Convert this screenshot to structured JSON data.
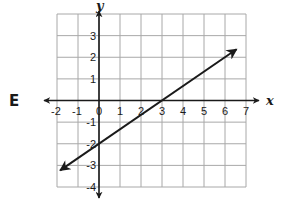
{
  "option_label": "E",
  "chart_data": {
    "type": "line",
    "title": "",
    "xlabel": "x",
    "ylabel": "y",
    "xlim": [
      -2,
      7
    ],
    "ylim": [
      -4,
      4
    ],
    "grid": true,
    "x_ticks": [
      -2,
      -1,
      0,
      1,
      2,
      3,
      4,
      5,
      6,
      7
    ],
    "x_tick_labels": [
      "-2",
      "-1",
      "0",
      "1",
      "2",
      "3",
      "4",
      "5",
      "6",
      "7"
    ],
    "y_ticks": [
      3,
      2,
      1,
      -1,
      -2,
      -3,
      -4
    ],
    "y_tick_labels": [
      "3",
      "2",
      "1",
      "-1",
      "-2",
      "-3",
      "-4"
    ],
    "series": [
      {
        "name": "line",
        "equation": "y = (2/3)x - 2",
        "x": [
          -1.85,
          6.55
        ],
        "y": [
          -3.23,
          2.37
        ],
        "arrows": "both",
        "color": "#1a1a1a"
      }
    ],
    "points_on_line": [
      {
        "x": 0,
        "y": -2
      },
      {
        "x": 3,
        "y": 0
      }
    ]
  },
  "colors": {
    "grid": "#a8a8a8",
    "axis": "#1a1a1a",
    "text": "#1a1a1a"
  }
}
